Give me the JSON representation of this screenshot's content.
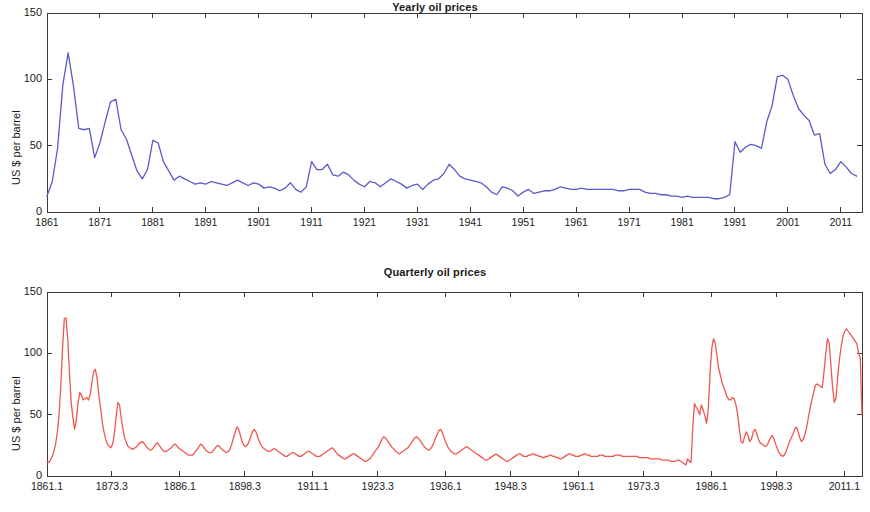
{
  "figure": {
    "width": 870,
    "height": 512,
    "background": "#ffffff"
  },
  "panels": [
    {
      "id": "yearly",
      "title": "Yearly oil prices",
      "ylabel": "US $ per barrel"
    },
    {
      "id": "quarterly",
      "title": "Quarterly oil prices",
      "ylabel": "US $ per barrel"
    }
  ],
  "chart_data": [
    {
      "type": "line",
      "title": "Yearly oil prices",
      "xlabel": "",
      "ylabel": "US $ per barrel",
      "ylim": [
        0,
        150
      ],
      "yticks": [
        0,
        50,
        100,
        150
      ],
      "xlim": [
        1861,
        2015
      ],
      "xticks": [
        1861,
        1871,
        1881,
        1891,
        1901,
        1911,
        1921,
        1931,
        1941,
        1951,
        1961,
        1971,
        1981,
        1991,
        2001,
        2011
      ],
      "grid": false,
      "legend": null,
      "color": "#5a5ac8",
      "series": [
        {
          "name": "Yearly oil price (real US$ per barrel)",
          "x": [
            1861,
            1862,
            1863,
            1864,
            1865,
            1866,
            1867,
            1868,
            1869,
            1870,
            1871,
            1872,
            1873,
            1874,
            1875,
            1876,
            1877,
            1878,
            1879,
            1880,
            1881,
            1882,
            1883,
            1884,
            1885,
            1886,
            1887,
            1888,
            1889,
            1890,
            1891,
            1892,
            1893,
            1894,
            1895,
            1896,
            1897,
            1898,
            1899,
            1900,
            1901,
            1902,
            1903,
            1904,
            1905,
            1906,
            1907,
            1908,
            1909,
            1910,
            1911,
            1912,
            1913,
            1914,
            1915,
            1916,
            1917,
            1918,
            1919,
            1920,
            1921,
            1922,
            1923,
            1924,
            1925,
            1926,
            1927,
            1928,
            1929,
            1930,
            1931,
            1932,
            1933,
            1934,
            1935,
            1936,
            1937,
            1938,
            1939,
            1940,
            1941,
            1942,
            1943,
            1944,
            1945,
            1946,
            1947,
            1948,
            1949,
            1950,
            1951,
            1952,
            1953,
            1954,
            1955,
            1956,
            1957,
            1958,
            1959,
            1960,
            1961,
            1962,
            1963,
            1964,
            1965,
            1966,
            1967,
            1968,
            1969,
            1970,
            1971,
            1972,
            1973,
            1974,
            1975,
            1976,
            1977,
            1978,
            1979,
            1980,
            1981,
            1982,
            1983,
            1984,
            1985,
            1986,
            1987,
            1988,
            1989,
            1990,
            1991,
            1992,
            1993,
            1994,
            1995,
            1996,
            1997,
            1998,
            1999,
            2000,
            2001,
            2002,
            2003,
            2004,
            2005,
            2006,
            2007,
            2008,
            2009,
            2010,
            2011,
            2012,
            2013,
            2014
          ],
          "y": [
            12,
            23,
            48,
            96,
            120,
            95,
            63,
            62,
            63,
            41,
            52,
            68,
            83,
            85,
            62,
            55,
            43,
            31,
            25,
            32,
            54,
            52,
            38,
            31,
            24,
            27,
            25,
            23,
            21,
            22,
            21,
            23,
            22,
            21,
            20,
            22,
            24,
            22,
            20,
            22,
            21,
            18,
            19,
            18,
            16,
            18,
            22,
            17,
            15,
            19,
            38,
            32,
            32,
            36,
            28,
            27,
            30,
            28,
            24,
            21,
            19,
            23,
            22,
            19,
            22,
            25,
            23,
            21,
            18,
            20,
            21,
            17,
            21,
            24,
            25,
            29,
            36,
            32,
            27,
            25,
            24,
            23,
            22,
            19,
            15,
            13,
            19,
            18,
            16,
            12,
            15,
            17,
            14,
            15,
            16,
            16,
            17,
            19,
            18,
            17,
            17,
            18,
            17,
            17,
            17,
            17,
            17,
            17,
            16,
            16,
            17,
            17,
            17,
            15,
            14,
            14,
            13,
            13,
            12,
            12,
            11,
            12,
            11,
            11,
            11,
            11,
            10,
            10,
            11,
            13,
            53,
            45,
            49,
            51,
            50,
            48,
            68,
            80,
            102,
            103,
            100,
            88,
            78,
            73,
            69,
            58,
            59,
            36,
            29,
            32,
            38,
            34,
            29,
            27,
            25,
            23,
            25,
            19,
            16,
            21,
            29,
            33,
            31,
            32,
            44,
            66,
            80,
            105,
            66,
            84,
            110,
            115,
            114,
            98,
            47
          ],
          "y_units": "US$ per barrel"
        }
      ]
    },
    {
      "type": "line",
      "title": "Quarterly oil prices",
      "xlabel": "",
      "ylabel": "US $ per barrel",
      "ylim": [
        0,
        150
      ],
      "yticks": [
        0,
        50,
        100,
        150
      ],
      "xlim": [
        1861.1,
        2014.4
      ],
      "xticks": [
        "1861.1",
        "1873.3",
        "1886.1",
        "1898.3",
        "1911.1",
        "1923.3",
        "1936.1",
        "1948.3",
        "1961.1",
        "1973.3",
        "1986.1",
        "1998.3",
        "2011.1"
      ],
      "xtick_positions": [
        1861.1,
        1873.3,
        1886.1,
        1898.3,
        1911.1,
        1923.3,
        1936.1,
        1948.3,
        1961.1,
        1973.3,
        1986.1,
        1998.3,
        2011.1
      ],
      "grid": false,
      "legend": null,
      "color": "#f0574f",
      "series": [
        {
          "name": "Quarterly oil price (real US$ per barrel)",
          "x_start": 1861.1,
          "x_step_quarters": 1,
          "y": [
            12,
            11,
            13,
            16,
            20,
            26,
            36,
            50,
            74,
            104,
            128,
            129,
            112,
            84,
            60,
            48,
            38,
            46,
            60,
            68,
            66,
            62,
            63,
            64,
            62,
            66,
            76,
            85,
            87,
            80,
            66,
            56,
            44,
            36,
            30,
            26,
            24,
            23,
            26,
            34,
            48,
            60,
            58,
            47,
            38,
            31,
            27,
            24,
            23,
            22,
            22,
            23,
            24,
            26,
            27,
            28,
            27,
            25,
            23,
            22,
            21,
            22,
            24,
            26,
            27,
            25,
            23,
            21,
            20,
            20,
            21,
            22,
            23,
            25,
            26,
            25,
            23,
            22,
            21,
            20,
            19,
            18,
            17,
            17,
            17,
            18,
            20,
            22,
            24,
            26,
            25,
            23,
            21,
            20,
            19,
            19,
            20,
            22,
            24,
            25,
            24,
            22,
            21,
            20,
            19,
            20,
            22,
            26,
            31,
            36,
            40,
            38,
            33,
            28,
            25,
            24,
            25,
            28,
            32,
            36,
            38,
            36,
            32,
            28,
            25,
            23,
            22,
            21,
            20,
            20,
            21,
            22,
            22,
            21,
            20,
            19,
            18,
            17,
            16,
            16,
            17,
            18,
            19,
            19,
            18,
            17,
            16,
            16,
            17,
            18,
            19,
            20,
            20,
            19,
            18,
            17,
            16,
            16,
            16,
            17,
            18,
            19,
            20,
            21,
            22,
            23,
            22,
            20,
            18,
            17,
            16,
            15,
            14,
            14,
            15,
            16,
            17,
            18,
            18,
            17,
            16,
            15,
            14,
            13,
            12,
            12,
            13,
            14,
            16,
            18,
            20,
            22,
            24,
            27,
            30,
            32,
            31,
            29,
            27,
            25,
            23,
            22,
            20,
            19,
            18,
            19,
            20,
            21,
            22,
            23,
            25,
            27,
            29,
            31,
            32,
            31,
            29,
            27,
            25,
            23,
            22,
            21,
            22,
            24,
            27,
            31,
            34,
            37,
            38,
            35,
            31,
            27,
            24,
            22,
            20,
            19,
            18,
            18,
            19,
            20,
            21,
            22,
            23,
            24,
            23,
            22,
            21,
            20,
            19,
            18,
            17,
            16,
            15,
            14,
            13,
            13,
            14,
            15,
            16,
            17,
            18,
            17,
            16,
            15,
            14,
            13,
            12,
            12,
            13,
            14,
            15,
            16,
            17,
            18,
            18,
            17,
            16,
            16,
            16,
            17,
            17,
            18,
            18,
            17,
            17,
            16,
            16,
            15,
            15,
            16,
            16,
            17,
            17,
            16,
            16,
            15,
            15,
            14,
            14,
            15,
            16,
            17,
            18,
            18,
            17,
            17,
            16,
            16,
            16,
            17,
            17,
            18,
            18,
            17,
            17,
            16,
            16,
            16,
            16,
            16,
            17,
            17,
            17,
            16,
            16,
            16,
            16,
            16,
            16,
            17,
            17,
            17,
            17,
            16,
            16,
            16,
            16,
            16,
            16,
            16,
            16,
            16,
            16,
            15,
            15,
            15,
            15,
            15,
            15,
            14,
            14,
            14,
            14,
            14,
            14,
            14,
            13,
            13,
            13,
            13,
            13,
            12,
            12,
            12,
            12,
            13,
            13,
            12,
            11,
            10,
            9,
            14,
            12,
            11,
            40,
            59,
            56,
            54,
            50,
            58,
            54,
            49,
            43,
            55,
            84,
            104,
            112,
            108,
            98,
            88,
            82,
            76,
            72,
            68,
            64,
            62,
            62,
            64,
            63,
            58,
            50,
            38,
            28,
            27,
            32,
            36,
            33,
            28,
            30,
            36,
            38,
            35,
            30,
            27,
            26,
            25,
            24,
            25,
            28,
            31,
            33,
            30,
            26,
            22,
            19,
            17,
            16,
            17,
            20,
            24,
            28,
            31,
            34,
            38,
            40,
            36,
            31,
            28,
            30,
            34,
            40,
            48,
            56,
            62,
            68,
            74,
            75,
            74,
            73,
            72,
            85,
            100,
            112,
            108,
            90,
            72,
            60,
            64,
            82,
            96,
            106,
            114,
            118,
            120,
            118,
            116,
            114,
            112,
            110,
            108,
            100,
            96,
            50
          ],
          "y_units": "US$ per barrel"
        }
      ]
    }
  ]
}
